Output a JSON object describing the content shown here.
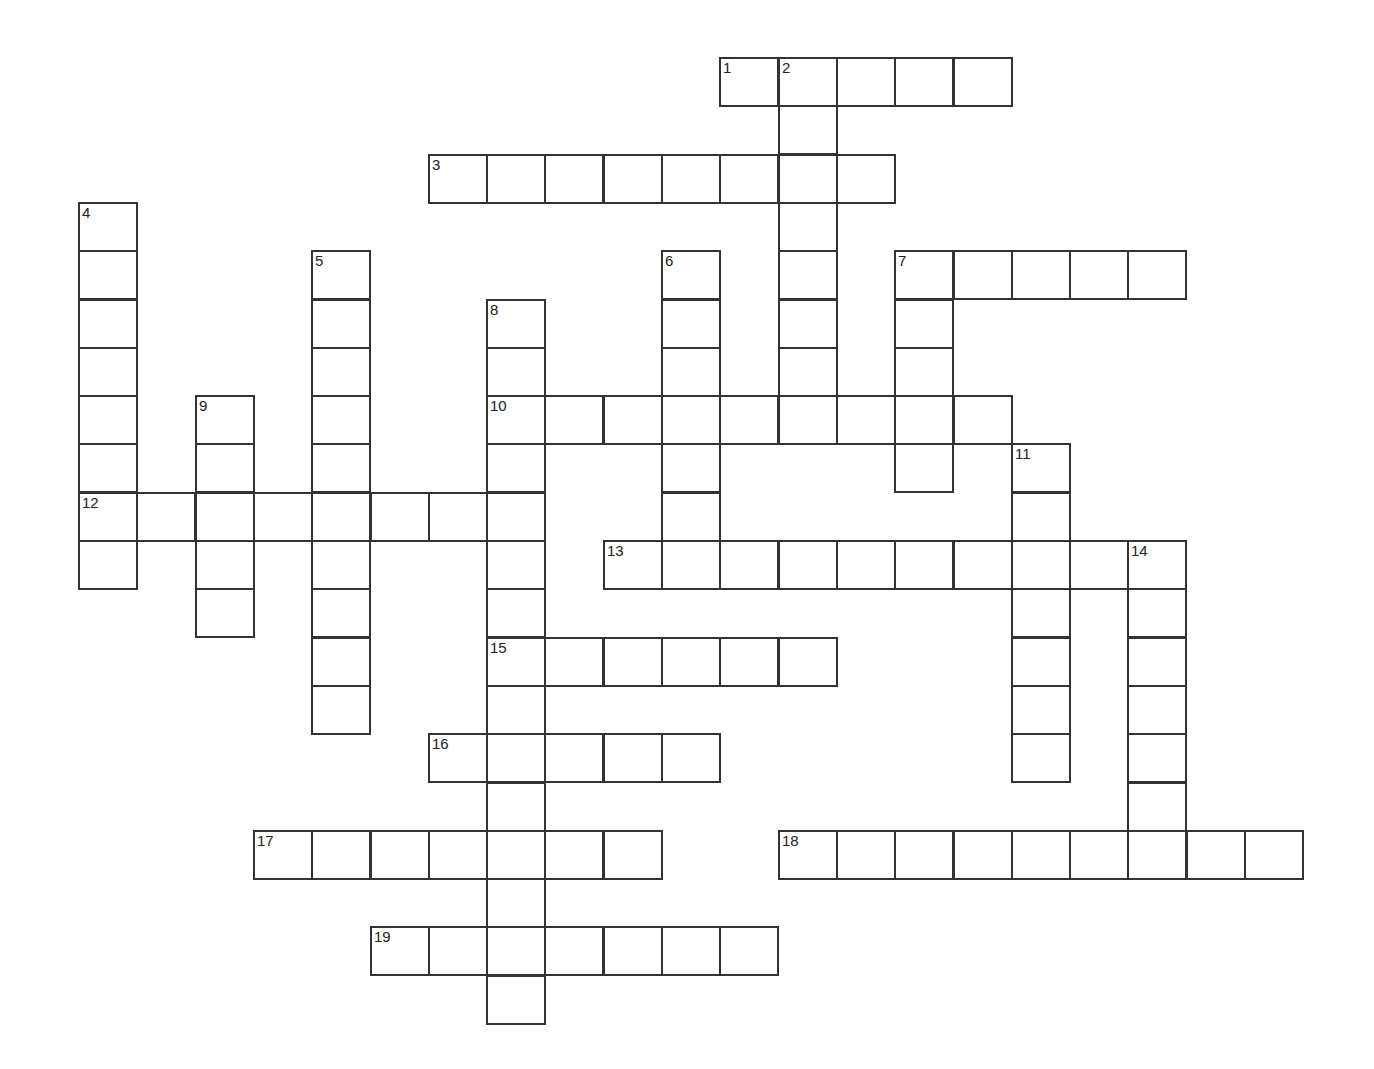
{
  "puzzle": {
    "title": "",
    "grid": {
      "origin_x": 78,
      "origin_y": 57,
      "cell_w": 58.3,
      "cell_h": 48.3
    },
    "words": [
      {
        "number": "1",
        "direction": "across",
        "col": 11,
        "row": 0,
        "length": 5
      },
      {
        "number": "2",
        "direction": "down",
        "col": 12,
        "row": 0,
        "length": 8
      },
      {
        "number": "3",
        "direction": "across",
        "col": 6,
        "row": 2,
        "length": 8
      },
      {
        "number": "4",
        "direction": "down",
        "col": 0,
        "row": 3,
        "length": 8
      },
      {
        "number": "5",
        "direction": "down",
        "col": 4,
        "row": 4,
        "length": 10
      },
      {
        "number": "6",
        "direction": "down",
        "col": 10,
        "row": 4,
        "length": 7
      },
      {
        "number": "7",
        "direction": "across",
        "col": 14,
        "row": 4,
        "length": 5
      },
      {
        "number": "7",
        "direction": "down",
        "col": 14,
        "row": 4,
        "length": 5
      },
      {
        "number": "8",
        "direction": "down",
        "col": 7,
        "row": 5,
        "length": 15
      },
      {
        "number": "9",
        "direction": "down",
        "col": 2,
        "row": 7,
        "length": 5
      },
      {
        "number": "10",
        "direction": "across",
        "col": 7,
        "row": 7,
        "length": 9
      },
      {
        "number": "11",
        "direction": "down",
        "col": 16,
        "row": 8,
        "length": 7
      },
      {
        "number": "12",
        "direction": "across",
        "col": 0,
        "row": 9,
        "length": 8
      },
      {
        "number": "13",
        "direction": "across",
        "col": 9,
        "row": 10,
        "length": 10
      },
      {
        "number": "14",
        "direction": "down",
        "col": 18,
        "row": 10,
        "length": 7
      },
      {
        "number": "15",
        "direction": "across",
        "col": 7,
        "row": 12,
        "length": 6
      },
      {
        "number": "16",
        "direction": "across",
        "col": 6,
        "row": 14,
        "length": 5
      },
      {
        "number": "17",
        "direction": "across",
        "col": 3,
        "row": 16,
        "length": 7
      },
      {
        "number": "18",
        "direction": "across",
        "col": 12,
        "row": 16,
        "length": 9
      },
      {
        "number": "19",
        "direction": "across",
        "col": 5,
        "row": 18,
        "length": 7
      }
    ]
  }
}
